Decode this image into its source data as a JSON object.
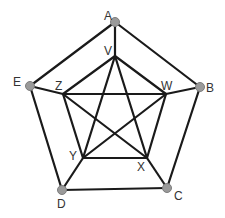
{
  "diagram": {
    "type": "graph",
    "colors": {
      "edge": "#1a1a1a",
      "node_fill": "#9a9a9a",
      "label": "#333333",
      "background": "#ffffff"
    },
    "nodes": [
      {
        "id": "A",
        "label": "A",
        "x": 115,
        "y": 22,
        "dot": true,
        "lx": 104,
        "ly": 20
      },
      {
        "id": "B",
        "label": "B",
        "x": 200,
        "y": 87,
        "dot": true,
        "lx": 206,
        "ly": 92
      },
      {
        "id": "C",
        "label": "C",
        "x": 167,
        "y": 188,
        "dot": true,
        "lx": 174,
        "ly": 200
      },
      {
        "id": "D",
        "label": "D",
        "x": 62,
        "y": 190,
        "dot": true,
        "lx": 57,
        "ly": 208
      },
      {
        "id": "E",
        "label": "E",
        "x": 30,
        "y": 86,
        "dot": true,
        "lx": 13,
        "ly": 86
      },
      {
        "id": "V",
        "label": "V",
        "x": 115,
        "y": 56,
        "dot": false,
        "lx": 104,
        "ly": 55
      },
      {
        "id": "W",
        "label": "W",
        "x": 166,
        "y": 94,
        "dot": false,
        "lx": 161,
        "ly": 90
      },
      {
        "id": "X",
        "label": "X",
        "x": 147,
        "y": 158,
        "dot": false,
        "lx": 137,
        "ly": 171
      },
      {
        "id": "Y",
        "label": "Y",
        "x": 83,
        "y": 158,
        "dot": false,
        "lx": 69,
        "ly": 160
      },
      {
        "id": "Z",
        "label": "Z",
        "x": 63,
        "y": 94,
        "dot": false,
        "lx": 55,
        "ly": 90
      }
    ],
    "edges": [
      [
        "A",
        "B"
      ],
      [
        "B",
        "C"
      ],
      [
        "C",
        "D"
      ],
      [
        "D",
        "E"
      ],
      [
        "E",
        "A"
      ],
      [
        "A",
        "V"
      ],
      [
        "B",
        "W"
      ],
      [
        "C",
        "X"
      ],
      [
        "D",
        "Y"
      ],
      [
        "E",
        "Z"
      ],
      [
        "V",
        "W"
      ],
      [
        "W",
        "X"
      ],
      [
        "X",
        "Y"
      ],
      [
        "Y",
        "Z"
      ],
      [
        "Z",
        "V"
      ],
      [
        "V",
        "X"
      ],
      [
        "V",
        "Y"
      ],
      [
        "W",
        "Y"
      ],
      [
        "W",
        "Z"
      ],
      [
        "Z",
        "X"
      ]
    ]
  }
}
